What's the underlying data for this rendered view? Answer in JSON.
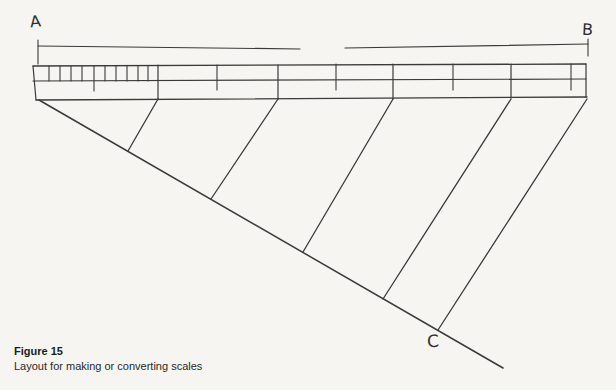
{
  "canvas": {
    "width": 616,
    "height": 390,
    "background": "#f6f5f1",
    "line_color": "#3a3a3a"
  },
  "labels": {
    "a": "A",
    "b": "B",
    "c": "C"
  },
  "caption": {
    "title": "Figure 15",
    "subtitle": "Layout for making or converting scales"
  },
  "diagram": {
    "lines": [
      {
        "name": "a-leader-vertical",
        "x1": 38,
        "y1": 40,
        "x2": 38,
        "y2": 64,
        "w": 1.1
      },
      {
        "name": "ab-line-left-segment",
        "x1": 38,
        "y1": 46,
        "x2": 300,
        "y2": 49,
        "w": 1.2
      },
      {
        "name": "ab-line-right-segment",
        "x1": 345,
        "y1": 48,
        "x2": 588,
        "y2": 44,
        "w": 1.2
      },
      {
        "name": "b-leader-vertical",
        "x1": 588,
        "y1": 39,
        "x2": 588,
        "y2": 56,
        "w": 1.1
      },
      {
        "name": "ruler-top-edge",
        "x1": 33,
        "y1": 66,
        "x2": 586,
        "y2": 64,
        "w": 1.3
      },
      {
        "name": "ruler-middle-line",
        "x1": 33,
        "y1": 81,
        "x2": 586,
        "y2": 79,
        "w": 1.2
      },
      {
        "name": "ruler-bottom-edge",
        "x1": 36,
        "y1": 100,
        "x2": 587,
        "y2": 97,
        "w": 1.3
      },
      {
        "name": "ruler-left-edge",
        "x1": 33,
        "y1": 66,
        "x2": 36,
        "y2": 100,
        "w": 1.2
      },
      {
        "name": "ruler-right-edge",
        "x1": 586,
        "y1": 64,
        "x2": 586,
        "y2": 97,
        "w": 1.2
      },
      {
        "name": "major-division",
        "x1": 158,
        "y1": 65,
        "x2": 158,
        "y2": 99,
        "w": 1.2
      },
      {
        "name": "major-division",
        "x1": 278,
        "y1": 65,
        "x2": 278,
        "y2": 99,
        "w": 1.2
      },
      {
        "name": "major-division",
        "x1": 393,
        "y1": 64,
        "x2": 393,
        "y2": 99,
        "w": 1.2
      },
      {
        "name": "major-division",
        "x1": 511,
        "y1": 64,
        "x2": 511,
        "y2": 98,
        "w": 1.2
      },
      {
        "name": "mid-tick",
        "x1": 217,
        "y1": 65,
        "x2": 217,
        "y2": 90,
        "w": 1.1
      },
      {
        "name": "mid-tick",
        "x1": 336,
        "y1": 64,
        "x2": 336,
        "y2": 90,
        "w": 1.1
      },
      {
        "name": "mid-tick",
        "x1": 453,
        "y1": 64,
        "x2": 453,
        "y2": 90,
        "w": 1.1
      },
      {
        "name": "mid-tick",
        "x1": 571,
        "y1": 64,
        "x2": 571,
        "y2": 90,
        "w": 1.1
      },
      {
        "name": "minor-tick",
        "x1": 49,
        "y1": 66,
        "x2": 49,
        "y2": 81,
        "w": 1.1
      },
      {
        "name": "minor-tick",
        "x1": 60,
        "y1": 66,
        "x2": 60,
        "y2": 81,
        "w": 1.1
      },
      {
        "name": "minor-tick",
        "x1": 71,
        "y1": 66,
        "x2": 71,
        "y2": 81,
        "w": 1.1
      },
      {
        "name": "minor-tick",
        "x1": 82,
        "y1": 66,
        "x2": 82,
        "y2": 81,
        "w": 1.1
      },
      {
        "name": "minor-tick-long",
        "x1": 94,
        "y1": 66,
        "x2": 94,
        "y2": 91,
        "w": 1.1
      },
      {
        "name": "minor-tick",
        "x1": 105,
        "y1": 66,
        "x2": 105,
        "y2": 81,
        "w": 1.1
      },
      {
        "name": "minor-tick",
        "x1": 116,
        "y1": 66,
        "x2": 116,
        "y2": 81,
        "w": 1.1
      },
      {
        "name": "minor-tick",
        "x1": 127,
        "y1": 66,
        "x2": 127,
        "y2": 81,
        "w": 1.1
      },
      {
        "name": "minor-tick",
        "x1": 138,
        "y1": 66,
        "x2": 138,
        "y2": 81,
        "w": 1.1
      },
      {
        "name": "minor-tick",
        "x1": 148,
        "y1": 66,
        "x2": 148,
        "y2": 81,
        "w": 1.1
      },
      {
        "name": "main-diagonal",
        "x1": 39,
        "y1": 100,
        "x2": 503,
        "y2": 368,
        "w": 1.5
      },
      {
        "name": "projection-line",
        "x1": 158,
        "y1": 99,
        "x2": 128,
        "y2": 151,
        "w": 1.3
      },
      {
        "name": "projection-line",
        "x1": 278,
        "y1": 99,
        "x2": 211,
        "y2": 199,
        "w": 1.3
      },
      {
        "name": "projection-line",
        "x1": 393,
        "y1": 99,
        "x2": 303,
        "y2": 252,
        "w": 1.3
      },
      {
        "name": "projection-line",
        "x1": 511,
        "y1": 99,
        "x2": 383,
        "y2": 299,
        "w": 1.3
      },
      {
        "name": "projection-line",
        "x1": 587,
        "y1": 99,
        "x2": 438,
        "y2": 330,
        "w": 1.3
      }
    ]
  }
}
